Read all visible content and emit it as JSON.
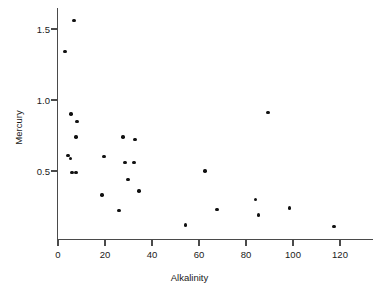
{
  "chart_data": {
    "type": "scatter",
    "title": "",
    "xlabel": "Alkalinity",
    "ylabel": "Mercury",
    "xlim": [
      -3,
      131
    ],
    "ylim": [
      0.0,
      1.68
    ],
    "grid": false,
    "legend": null,
    "xticks": [
      0,
      20,
      40,
      60,
      80,
      100,
      120
    ],
    "xtick_labels": [
      "0",
      "20",
      "40",
      "60",
      "80",
      "100",
      "120"
    ],
    "yticks": [
      0.5,
      1.0,
      1.5
    ],
    "ytick_labels": [
      "0.5",
      "1.0",
      "1.5"
    ],
    "points": [
      {
        "x": 6.8,
        "y": 1.56
      },
      {
        "x": 3.0,
        "y": 1.34
      },
      {
        "x": 5.5,
        "y": 0.9
      },
      {
        "x": 8.1,
        "y": 0.85
      },
      {
        "x": 7.7,
        "y": 0.74
      },
      {
        "x": 4.3,
        "y": 0.61
      },
      {
        "x": 5.2,
        "y": 0.59
      },
      {
        "x": 6.0,
        "y": 0.49
      },
      {
        "x": 7.7,
        "y": 0.49
      },
      {
        "x": 27.7,
        "y": 0.74
      },
      {
        "x": 32.8,
        "y": 0.72
      },
      {
        "x": 19.6,
        "y": 0.6
      },
      {
        "x": 28.5,
        "y": 0.56
      },
      {
        "x": 32.3,
        "y": 0.56
      },
      {
        "x": 29.8,
        "y": 0.44
      },
      {
        "x": 34.4,
        "y": 0.36
      },
      {
        "x": 18.7,
        "y": 0.33
      },
      {
        "x": 26.0,
        "y": 0.22
      },
      {
        "x": 89.4,
        "y": 0.91
      },
      {
        "x": 62.6,
        "y": 0.5
      },
      {
        "x": 84.0,
        "y": 0.3
      },
      {
        "x": 67.7,
        "y": 0.23
      },
      {
        "x": 85.2,
        "y": 0.19
      },
      {
        "x": 98.4,
        "y": 0.24
      },
      {
        "x": 54.3,
        "y": 0.12
      },
      {
        "x": 117.4,
        "y": 0.11
      }
    ]
  },
  "axes": {
    "x_title": "Alkalinity",
    "y_title": "Mercury"
  },
  "colors": {
    "point": "#111111",
    "axis": "#4a4a4a",
    "text": "#1a1a1a",
    "background": "#ffffff"
  }
}
